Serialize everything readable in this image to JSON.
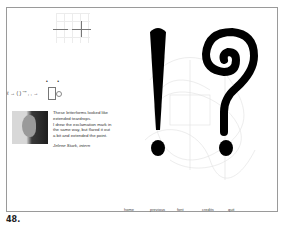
{
  "figure": {
    "number": "48."
  },
  "artwork": {
    "glyphs": [
      "!",
      "?"
    ],
    "glyph_color": "#000000",
    "formula_text": "ℓ → ( ) ‘’” , , →",
    "dots": "• •"
  },
  "bio": {
    "lines": [
      "These letterforms looked like",
      "extended teardrops.",
      "I drew the exclamation mark in",
      "the same way, but flared it out",
      "a bit and extended the point."
    ],
    "signature": "Jelene Stark, intern"
  },
  "nav": {
    "items": [
      {
        "label": "home"
      },
      {
        "label": "previous"
      },
      {
        "label": "font"
      },
      {
        "label": "credits"
      },
      {
        "label": "quit"
      }
    ]
  }
}
